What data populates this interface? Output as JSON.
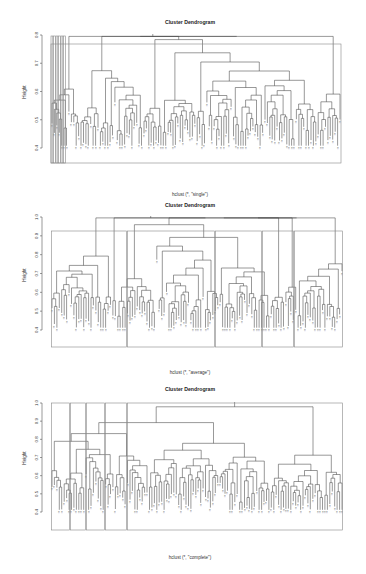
{
  "chart_data": [
    {
      "type": "dendrogram",
      "title": "Cluster Dendrogram",
      "xlabel": "hclust (*, \"single\")",
      "sublabel": "",
      "ylabel": "Height",
      "yticks": [
        0.4,
        0.5,
        0.6,
        0.7,
        0.8
      ],
      "ylim": [
        0.4,
        0.8
      ],
      "layout": {
        "top": 35,
        "bottom": 148,
        "ymax": 0.8,
        "ymin": 0.4,
        "x0": 52,
        "x1": 340,
        "title_y": 22,
        "xlabel_y": 194,
        "box": [
          51,
          44,
          341,
          163
        ],
        "axis_x": 42,
        "baseline": 163
      },
      "clusters_boxed": 6,
      "leaf_count": 120,
      "seed": 11,
      "method": "single"
    },
    {
      "type": "dendrogram",
      "title": "Cluster Dendrogram",
      "xlabel": "hclust (*, \"average\")",
      "sublabel": "",
      "ylabel": "Height",
      "yticks": [
        0.4,
        0.5,
        0.6,
        0.7,
        0.8,
        0.9,
        1.0
      ],
      "ylim": [
        0.4,
        1.0
      ],
      "layout": {
        "top": 217,
        "bottom": 330,
        "ymax": 1.0,
        "ymin": 0.4,
        "x0": 52,
        "x1": 342,
        "title_y": 205,
        "xlabel_y": 372,
        "box": [
          51,
          231,
          343,
          347
        ],
        "axis_x": 42,
        "baseline": 347
      },
      "cluster_boundaries": [
        51,
        127,
        215,
        262,
        294,
        343
      ],
      "leaf_count": 120,
      "seed": 23,
      "method": "average"
    },
    {
      "type": "dendrogram",
      "title": "Cluster Dendrogram",
      "xlabel": "hclust (*, \"complete\")",
      "sublabel": "",
      "ylabel": "Height",
      "yticks": [
        0.4,
        0.5,
        0.6,
        0.7,
        0.8,
        0.9,
        1.0
      ],
      "ylim": [
        0.4,
        1.0
      ],
      "layout": {
        "top": 403,
        "bottom": 512,
        "ymax": 1.0,
        "ymin": 0.4,
        "x0": 52,
        "x1": 342,
        "title_y": 389,
        "xlabel_y": 557,
        "box": [
          51,
          403,
          343,
          530
        ],
        "axis_x": 42,
        "baseline": 530
      },
      "cluster_boundaries": [
        51,
        70,
        86,
        105,
        127,
        343
      ],
      "leaf_count": 120,
      "seed": 37,
      "method": "complete"
    }
  ],
  "plots": [
    {
      "title": "Cluster Dendrogram",
      "xlabel": "hclust (*, \"single\")",
      "ylabel": "Height"
    },
    {
      "title": "Cluster Dendrogram",
      "xlabel": "hclust (*, \"average\")",
      "ylabel": "Height"
    },
    {
      "title": "Cluster Dendrogram",
      "xlabel": "hclust (*, \"complete\")",
      "ylabel": "Height"
    }
  ]
}
